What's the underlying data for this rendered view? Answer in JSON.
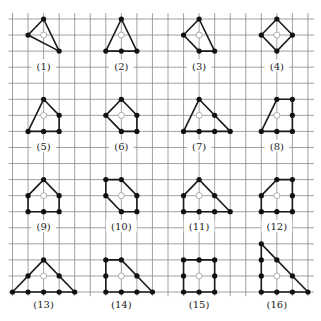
{
  "diagram": {
    "title": "",
    "grid": {
      "columns": 20,
      "rows": 18,
      "origin_x": 12.5,
      "origin_y": 19,
      "cell_w": 15.55,
      "cell_h": 16.06,
      "line_color": "#8a8a8a",
      "top_stub": 6
    },
    "colors": {
      "edge": "#1a1a1a",
      "vertex": "#111111",
      "center_marker": "#9a9a9a"
    },
    "shapes": [
      {
        "label": "(1)",
        "center": [
          2,
          1
        ],
        "polygon": [
          [
            2,
            0
          ],
          [
            3,
            2
          ],
          [
            1,
            1
          ]
        ],
        "dots": [
          [
            2,
            0
          ],
          [
            1,
            1
          ],
          [
            3,
            2
          ]
        ],
        "label_pos": [
          2,
          2.95
        ]
      },
      {
        "label": "(2)",
        "center": [
          7,
          1
        ],
        "polygon": [
          [
            7,
            0
          ],
          [
            8,
            2
          ],
          [
            6,
            2
          ]
        ],
        "dots": [
          [
            7,
            0
          ],
          [
            6,
            2
          ],
          [
            7,
            2
          ],
          [
            8,
            2
          ]
        ],
        "label_pos": [
          7,
          2.95
        ]
      },
      {
        "label": "(3)",
        "center": [
          12,
          1
        ],
        "polygon": [
          [
            12,
            0
          ],
          [
            13,
            2
          ],
          [
            12,
            2
          ],
          [
            11,
            1
          ]
        ],
        "dots": [
          [
            12,
            0
          ],
          [
            11,
            1
          ],
          [
            12,
            2
          ],
          [
            13,
            2
          ]
        ],
        "label_pos": [
          12,
          2.95
        ]
      },
      {
        "label": "(4)",
        "center": [
          17,
          1
        ],
        "polygon": [
          [
            17,
            0
          ],
          [
            18,
            1
          ],
          [
            17,
            2
          ],
          [
            16,
            1
          ]
        ],
        "dots": [
          [
            17,
            0
          ],
          [
            16,
            1
          ],
          [
            18,
            1
          ],
          [
            17,
            2
          ]
        ],
        "label_pos": [
          17,
          2.95
        ]
      },
      {
        "label": "(5)",
        "center": [
          2,
          6
        ],
        "polygon": [
          [
            2,
            5
          ],
          [
            3,
            6
          ],
          [
            3,
            7
          ],
          [
            1,
            7
          ]
        ],
        "dots": [
          [
            2,
            5
          ],
          [
            3,
            6
          ],
          [
            3,
            7
          ],
          [
            2,
            7
          ],
          [
            1,
            7
          ]
        ],
        "label_pos": [
          2,
          7.95
        ]
      },
      {
        "label": "(6)",
        "center": [
          7,
          6
        ],
        "polygon": [
          [
            7,
            5
          ],
          [
            8,
            6
          ],
          [
            8,
            7
          ],
          [
            7,
            7
          ],
          [
            6,
            6
          ]
        ],
        "dots": [
          [
            7,
            5
          ],
          [
            8,
            6
          ],
          [
            8,
            7
          ],
          [
            7,
            7
          ],
          [
            6,
            6
          ]
        ],
        "label_pos": [
          7,
          7.95
        ]
      },
      {
        "label": "(7)",
        "center": [
          12,
          6
        ],
        "polygon": [
          [
            12,
            5
          ],
          [
            14,
            7
          ],
          [
            11,
            7
          ]
        ],
        "dots": [
          [
            12,
            5
          ],
          [
            13,
            6
          ],
          [
            14,
            7
          ],
          [
            13,
            7
          ],
          [
            12,
            7
          ],
          [
            11,
            7
          ]
        ],
        "label_pos": [
          12,
          7.95
        ]
      },
      {
        "label": "(8)",
        "center": [
          17,
          6
        ],
        "polygon": [
          [
            17,
            5
          ],
          [
            18,
            5
          ],
          [
            18,
            7
          ],
          [
            16,
            7
          ]
        ],
        "dots": [
          [
            17,
            5
          ],
          [
            18,
            5
          ],
          [
            18,
            6
          ],
          [
            18,
            7
          ],
          [
            17,
            7
          ],
          [
            16,
            7
          ]
        ],
        "label_pos": [
          17,
          7.95
        ]
      },
      {
        "label": "(9)",
        "center": [
          2,
          11
        ],
        "polygon": [
          [
            2,
            10
          ],
          [
            3,
            11
          ],
          [
            3,
            12
          ],
          [
            1,
            12
          ],
          [
            1,
            11
          ]
        ],
        "dots": [
          [
            2,
            10
          ],
          [
            3,
            11
          ],
          [
            3,
            12
          ],
          [
            2,
            12
          ],
          [
            1,
            12
          ],
          [
            1,
            11
          ]
        ],
        "label_pos": [
          2,
          12.95
        ]
      },
      {
        "label": "(10)",
        "center": [
          7,
          11
        ],
        "polygon": [
          [
            6,
            10
          ],
          [
            7,
            10
          ],
          [
            8,
            11
          ],
          [
            8,
            12
          ],
          [
            7,
            12
          ],
          [
            6,
            11
          ]
        ],
        "dots": [
          [
            6,
            10
          ],
          [
            7,
            10
          ],
          [
            8,
            11
          ],
          [
            8,
            12
          ],
          [
            7,
            12
          ],
          [
            6,
            11
          ]
        ],
        "label_pos": [
          7,
          12.95
        ]
      },
      {
        "label": "(11)",
        "center": [
          12,
          11
        ],
        "polygon": [
          [
            12,
            10
          ],
          [
            14,
            12
          ],
          [
            11,
            12
          ],
          [
            11,
            11
          ]
        ],
        "dots": [
          [
            12,
            10
          ],
          [
            13,
            11
          ],
          [
            14,
            12
          ],
          [
            13,
            12
          ],
          [
            12,
            12
          ],
          [
            11,
            12
          ],
          [
            11,
            11
          ]
        ],
        "label_pos": [
          12,
          12.95
        ]
      },
      {
        "label": "(12)",
        "center": [
          17,
          11
        ],
        "polygon": [
          [
            17,
            10
          ],
          [
            18,
            10
          ],
          [
            18,
            12
          ],
          [
            16,
            12
          ],
          [
            16,
            11
          ]
        ],
        "dots": [
          [
            17,
            10
          ],
          [
            18,
            10
          ],
          [
            18,
            11
          ],
          [
            18,
            12
          ],
          [
            17,
            12
          ],
          [
            16,
            12
          ],
          [
            16,
            11
          ]
        ],
        "label_pos": [
          17,
          12.95
        ]
      },
      {
        "label": "(13)",
        "center": [
          2,
          16
        ],
        "polygon": [
          [
            2,
            15
          ],
          [
            4,
            17
          ],
          [
            0,
            17
          ]
        ],
        "dots": [
          [
            2,
            15
          ],
          [
            3,
            16
          ],
          [
            4,
            17
          ],
          [
            3,
            17
          ],
          [
            2,
            17
          ],
          [
            1,
            17
          ],
          [
            0,
            17
          ],
          [
            1,
            16
          ]
        ],
        "label_pos": [
          2,
          17.8
        ]
      },
      {
        "label": "(14)",
        "center": [
          7,
          16
        ],
        "polygon": [
          [
            6,
            15
          ],
          [
            7,
            15
          ],
          [
            9,
            17
          ],
          [
            6,
            17
          ]
        ],
        "dots": [
          [
            6,
            15
          ],
          [
            7,
            15
          ],
          [
            8,
            16
          ],
          [
            9,
            17
          ],
          [
            8,
            17
          ],
          [
            7,
            17
          ],
          [
            6,
            17
          ],
          [
            6,
            16
          ]
        ],
        "label_pos": [
          7,
          17.8
        ]
      },
      {
        "label": "(15)",
        "center": [
          12,
          16
        ],
        "polygon": [
          [
            11,
            15
          ],
          [
            13,
            15
          ],
          [
            13,
            17
          ],
          [
            11,
            17
          ]
        ],
        "dots": [
          [
            11,
            15
          ],
          [
            12,
            15
          ],
          [
            13,
            15
          ],
          [
            13,
            16
          ],
          [
            13,
            17
          ],
          [
            12,
            17
          ],
          [
            11,
            17
          ],
          [
            11,
            16
          ]
        ],
        "label_pos": [
          12,
          17.8
        ]
      },
      {
        "label": "(16)",
        "center": [
          17,
          16
        ],
        "polygon": [
          [
            16,
            14
          ],
          [
            19,
            17
          ],
          [
            16,
            17
          ]
        ],
        "dots": [
          [
            16,
            14
          ],
          [
            17,
            15
          ],
          [
            18,
            16
          ],
          [
            19,
            17
          ],
          [
            18,
            17
          ],
          [
            17,
            17
          ],
          [
            16,
            17
          ],
          [
            16,
            16
          ],
          [
            16,
            15
          ]
        ],
        "label_pos": [
          17,
          17.8
        ]
      }
    ]
  }
}
